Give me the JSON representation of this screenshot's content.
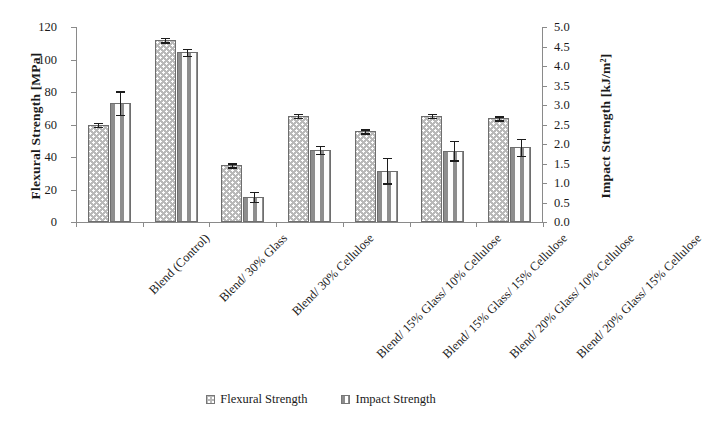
{
  "chart_data": {
    "type": "bar",
    "title": "",
    "xlabel": "",
    "categories": [
      "Blend (Control)",
      "Blend/ 30% Glass",
      "Blend/ 30% Cellulose",
      "Blend/ 15% Glass/ 10% Cellulose",
      "Blend/ 15% Glass/ 15% Cellulose",
      "Blend/ 20% Glass/ 10% Cellulose",
      "Blend/ 20% Glass/ 15% Cellulose"
    ],
    "series": [
      {
        "name": "Flexural Strength",
        "axis": "left",
        "unit": "MPa",
        "values": [
          60,
          112,
          35,
          65.5,
          56,
          65.5,
          64
        ],
        "errors": [
          1.2,
          1.5,
          1.0,
          1.0,
          1.0,
          1.0,
          0.8
        ]
      },
      {
        "name": "Impact Strength",
        "axis": "right",
        "unit": "kJ/m2",
        "values": [
          3.05,
          4.35,
          0.65,
          1.85,
          1.32,
          1.83,
          1.92
        ],
        "errors": [
          0.3,
          0.09,
          0.13,
          0.1,
          0.33,
          0.25,
          0.22
        ]
      }
    ],
    "left_axis": {
      "label": "Flexural Strength [MPa]",
      "ylim": [
        0,
        120
      ],
      "ticks": [
        "0",
        "20",
        "40",
        "60",
        "80",
        "100",
        "120"
      ],
      "tick_values": [
        0,
        20,
        40,
        60,
        80,
        100,
        120
      ]
    },
    "right_axis": {
      "label": "Impact Strength [kJ/m²]",
      "ylim": [
        0,
        5
      ],
      "ticks": [
        "0.0",
        "0.5",
        "1.0",
        "1.5",
        "2.0",
        "2.5",
        "3.0",
        "3.5",
        "4.0",
        "4.5",
        "5.0"
      ],
      "tick_values": [
        0,
        0.5,
        1.0,
        1.5,
        2.0,
        2.5,
        3.0,
        3.5,
        4.0,
        4.5,
        5.0
      ]
    },
    "legend": {
      "position": "bottom-center",
      "entries": [
        {
          "label": "Flexural Strength",
          "swatch": "gray-dotted"
        },
        {
          "label": "Impact Strength",
          "swatch": "white-dashed"
        }
      ]
    },
    "grid": false
  }
}
